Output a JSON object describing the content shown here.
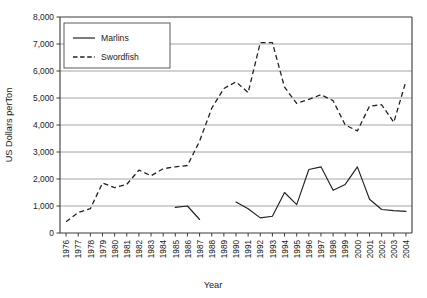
{
  "chart_data": {
    "type": "line",
    "title": "",
    "xlabel": "Year",
    "ylabel": "US Dollars perTon",
    "ylim": [
      0,
      8000
    ],
    "ytick_step": 1000,
    "grid": "horizontal",
    "legend_position": "top-left-inside",
    "x": [
      1976,
      1977,
      1978,
      1979,
      1980,
      1981,
      1982,
      1983,
      1984,
      1985,
      1986,
      1987,
      1988,
      1989,
      1990,
      1991,
      1992,
      1993,
      1994,
      1995,
      1996,
      1997,
      1998,
      1999,
      2000,
      2001,
      2002,
      2003,
      2004
    ],
    "ytick_labels": [
      "0",
      "1,000",
      "2,000",
      "3,000",
      "4,000",
      "5,000",
      "6,000",
      "7,000",
      "8,000"
    ],
    "xtick_labels": [
      "1976",
      "1977",
      "1978",
      "1979",
      "1980",
      "1981",
      "1982",
      "1983",
      "1984",
      "1985",
      "1986",
      "1987",
      "1988",
      "1989",
      "1990",
      "1991",
      "1992",
      "1993",
      "1994",
      "1995",
      "1996",
      "1997",
      "1998",
      "1999",
      "2000",
      "2001",
      "2002",
      "2003",
      "2004"
    ],
    "series": [
      {
        "name": "Marlins",
        "style": "solid",
        "color": "#222222",
        "values": [
          null,
          null,
          null,
          null,
          null,
          null,
          null,
          null,
          null,
          950,
          1000,
          500,
          null,
          null,
          1150,
          900,
          560,
          620,
          1500,
          1050,
          2350,
          2450,
          1580,
          1800,
          2450,
          1250,
          870,
          830,
          800
        ]
      },
      {
        "name": "Swordfish",
        "style": "dashed",
        "color": "#222222",
        "values": [
          420,
          760,
          900,
          1850,
          1680,
          1800,
          2330,
          2120,
          2380,
          2450,
          2500,
          3400,
          4620,
          5350,
          5600,
          5200,
          7050,
          7050,
          5400,
          4800,
          4950,
          5120,
          4900,
          4000,
          3780,
          4700,
          4750,
          4100,
          5620
        ]
      }
    ],
    "legend": [
      {
        "label": "Marlins",
        "style": "solid"
      },
      {
        "label": "Swordfish",
        "style": "dashed"
      }
    ]
  }
}
